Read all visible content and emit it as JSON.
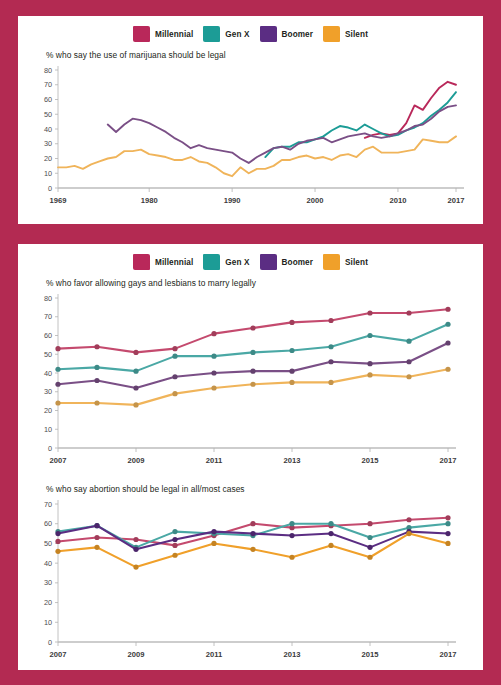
{
  "border_color": "#b32a52",
  "legend": {
    "items": [
      {
        "label": "Millennial",
        "color": "#b9285a"
      },
      {
        "label": "Gen X",
        "color": "#1c9c96"
      },
      {
        "label": "Boomer",
        "color": "#5b2d83"
      },
      {
        "label": "Silent",
        "color": "#f0a02a"
      }
    ]
  },
  "chart_data": [
    {
      "type": "line",
      "title": "% who say the use of marijuana should be legal",
      "xlabel": "",
      "ylabel": "",
      "ylim": [
        0,
        80
      ],
      "yticks": [
        0,
        10,
        20,
        30,
        40,
        50,
        60,
        70,
        80
      ],
      "xlim": [
        1969,
        2017
      ],
      "xticks": [
        1969,
        1980,
        1990,
        2000,
        2010,
        2017
      ],
      "xtick_labels": [
        "1969",
        "1980",
        "1990",
        "2000",
        "2010",
        "2017"
      ],
      "grid": false,
      "legend_position": "top-center",
      "markers": false,
      "series": [
        {
          "name": "Millennial",
          "color": "#b9285a",
          "x": [
            2006,
            2007,
            2008,
            2009,
            2010,
            2011,
            2012,
            2013,
            2014,
            2015,
            2016,
            2017
          ],
          "values": [
            34,
            36,
            37,
            36,
            37,
            44,
            56,
            53,
            61,
            68,
            72,
            70
          ]
        },
        {
          "name": "Gen X",
          "color": "#1c9c96",
          "x": [
            1994,
            1995,
            1996,
            1997,
            1998,
            1999,
            2000,
            2001,
            2002,
            2003,
            2004,
            2005,
            2006,
            2007,
            2008,
            2009,
            2010,
            2011,
            2012,
            2013,
            2014,
            2015,
            2016,
            2017
          ],
          "values": [
            21,
            27,
            28,
            28,
            31,
            31,
            33,
            35,
            39,
            42,
            41,
            39,
            43,
            40,
            37,
            35,
            36,
            39,
            41,
            44,
            49,
            53,
            58,
            65
          ]
        },
        {
          "name": "Boomer",
          "color": "#7a4f86",
          "x": [
            1975,
            1976,
            1977,
            1978,
            1979,
            1980,
            1981,
            1982,
            1983,
            1984,
            1985,
            1986,
            1987,
            1988,
            1989,
            1990,
            1991,
            1992,
            1993,
            1994,
            1995,
            1996,
            1997,
            1998,
            1999,
            2000,
            2001,
            2002,
            2003,
            2004,
            2005,
            2006,
            2007,
            2008,
            2009,
            2010,
            2011,
            2012,
            2013,
            2014,
            2015,
            2016,
            2017
          ],
          "values": [
            43,
            38,
            43,
            47,
            46,
            44,
            41,
            38,
            34,
            31,
            27,
            29,
            27,
            26,
            25,
            24,
            20,
            17,
            21,
            24,
            27,
            28,
            26,
            30,
            32,
            33,
            34,
            31,
            33,
            35,
            36,
            37,
            35,
            34,
            35,
            37,
            39,
            42,
            43,
            47,
            52,
            55,
            56
          ]
        },
        {
          "name": "Silent",
          "color": "#f0b45a",
          "x": [
            1969,
            1970,
            1971,
            1972,
            1973,
            1974,
            1975,
            1976,
            1977,
            1978,
            1979,
            1980,
            1981,
            1982,
            1983,
            1984,
            1985,
            1986,
            1987,
            1988,
            1989,
            1990,
            1991,
            1992,
            1993,
            1994,
            1995,
            1996,
            1997,
            1998,
            1999,
            2000,
            2001,
            2002,
            2003,
            2004,
            2005,
            2006,
            2007,
            2008,
            2009,
            2010,
            2011,
            2012,
            2013,
            2014,
            2015,
            2016,
            2017
          ],
          "values": [
            14,
            14,
            15,
            13,
            16,
            18,
            20,
            21,
            25,
            25,
            26,
            23,
            22,
            21,
            19,
            19,
            21,
            18,
            17,
            14,
            10,
            8,
            14,
            10,
            13,
            13,
            15,
            19,
            19,
            21,
            22,
            20,
            21,
            19,
            22,
            23,
            21,
            26,
            28,
            24,
            24,
            24,
            25,
            26,
            33,
            32,
            31,
            31,
            35
          ]
        }
      ]
    },
    {
      "type": "line",
      "title": "% who favor allowing gays and lesbians to marry legally",
      "xlabel": "",
      "ylabel": "",
      "ylim": [
        0,
        80
      ],
      "yticks": [
        0,
        10,
        20,
        30,
        40,
        50,
        60,
        70,
        80
      ],
      "xlim": [
        2007,
        2017
      ],
      "xticks": [
        2007,
        2009,
        2011,
        2013,
        2015,
        2017
      ],
      "xtick_labels": [
        "2007",
        "2009",
        "2011",
        "2013",
        "2015",
        "2017"
      ],
      "grid": false,
      "legend_position": "top-center",
      "markers": true,
      "series": [
        {
          "name": "Millennial",
          "color": "#c44a6e",
          "x": [
            2007,
            2008,
            2009,
            2010,
            2011,
            2012,
            2013,
            2014,
            2015,
            2016,
            2017
          ],
          "values": [
            53,
            54,
            51,
            53,
            61,
            64,
            67,
            68,
            72,
            72,
            74
          ]
        },
        {
          "name": "Gen X",
          "color": "#4aa8a5",
          "x": [
            2007,
            2008,
            2009,
            2010,
            2011,
            2012,
            2013,
            2014,
            2015,
            2016,
            2017
          ],
          "values": [
            42,
            43,
            41,
            49,
            49,
            51,
            52,
            54,
            60,
            57,
            66
          ]
        },
        {
          "name": "Boomer",
          "color": "#7a4f86",
          "x": [
            2007,
            2008,
            2009,
            2010,
            2011,
            2012,
            2013,
            2014,
            2015,
            2016,
            2017
          ],
          "values": [
            34,
            36,
            32,
            38,
            40,
            41,
            41,
            46,
            45,
            46,
            56
          ]
        },
        {
          "name": "Silent",
          "color": "#f0b45a",
          "x": [
            2007,
            2008,
            2009,
            2010,
            2011,
            2012,
            2013,
            2014,
            2015,
            2016,
            2017
          ],
          "values": [
            24,
            24,
            23,
            29,
            32,
            34,
            35,
            35,
            39,
            38,
            42
          ]
        }
      ]
    },
    {
      "type": "line",
      "title": "% who say abortion should be legal in all/most cases",
      "xlabel": "",
      "ylabel": "",
      "ylim": [
        0,
        70
      ],
      "yticks": [
        0,
        10,
        20,
        30,
        40,
        50,
        60,
        70
      ],
      "xlim": [
        2007,
        2017
      ],
      "xticks": [
        2007,
        2009,
        2011,
        2013,
        2015,
        2017
      ],
      "xtick_labels": [
        "2007",
        "2009",
        "2011",
        "2013",
        "2015",
        "2017"
      ],
      "grid": false,
      "legend_position": "none",
      "markers": true,
      "series": [
        {
          "name": "Millennial",
          "color": "#c44a6e",
          "x": [
            2007,
            2008,
            2009,
            2010,
            2011,
            2012,
            2013,
            2014,
            2015,
            2016,
            2017
          ],
          "values": [
            51,
            53,
            52,
            49,
            54,
            60,
            58,
            59,
            60,
            62,
            63
          ]
        },
        {
          "name": "Gen X",
          "color": "#4aa8a5",
          "x": [
            2007,
            2008,
            2009,
            2010,
            2011,
            2012,
            2013,
            2014,
            2015,
            2016,
            2017
          ],
          "values": [
            56,
            59,
            48,
            56,
            55,
            54,
            60,
            60,
            53,
            58,
            60
          ]
        },
        {
          "name": "Boomer",
          "color": "#5b2d83",
          "x": [
            2007,
            2008,
            2009,
            2010,
            2011,
            2012,
            2013,
            2014,
            2015,
            2016,
            2017
          ],
          "values": [
            55,
            59,
            47,
            52,
            56,
            55,
            54,
            55,
            48,
            56,
            55
          ]
        },
        {
          "name": "Silent",
          "color": "#f0a02a",
          "x": [
            2007,
            2008,
            2009,
            2010,
            2011,
            2012,
            2013,
            2014,
            2015,
            2016,
            2017
          ],
          "values": [
            46,
            48,
            38,
            44,
            50,
            47,
            43,
            49,
            43,
            55,
            50
          ]
        }
      ]
    }
  ]
}
